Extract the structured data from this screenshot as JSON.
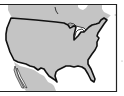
{
  "map": {
    "subject": "Contiguous United States outline map",
    "colors": {
      "land": "#c4c4c4",
      "water": "#ffffff",
      "border": "#111111",
      "frame": "#222222"
    },
    "regions": [
      "Canada",
      "United States",
      "Mexico"
    ],
    "features": [
      "Great Lakes",
      "Gulf of Mexico",
      "Florida peninsula",
      "Baja California"
    ]
  }
}
